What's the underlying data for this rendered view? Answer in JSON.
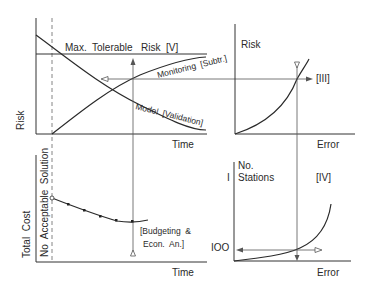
{
  "diagram": {
    "panels": {
      "top_left": {
        "y_label": "Risk",
        "x_label": "Time",
        "threshold_label": "Max.  Tolerable   Risk  [V]",
        "curve_rising_label": "Monitoring  [Subtr.]",
        "curve_falling_label": "Model  [Validation]"
      },
      "top_right": {
        "y_label": "Risk",
        "x_label": "Error",
        "tag": "[III]"
      },
      "bottom_left": {
        "y_label": "Total  Cost",
        "region_label": "No  Acceptable  Solution",
        "x_label": "Time",
        "note_line1": "[Budgeting  &",
        "note_line2": "Econ.  An.]"
      },
      "bottom_right": {
        "y_label_line1": "No.",
        "y_label_line2": "Stations",
        "tick_top": "I",
        "tick_bottom": "IOO",
        "x_label": "Error",
        "tag": "[IV]"
      }
    },
    "colors": {
      "line": "#333333",
      "text": "#2a2a2a",
      "background": "#ffffff"
    }
  }
}
